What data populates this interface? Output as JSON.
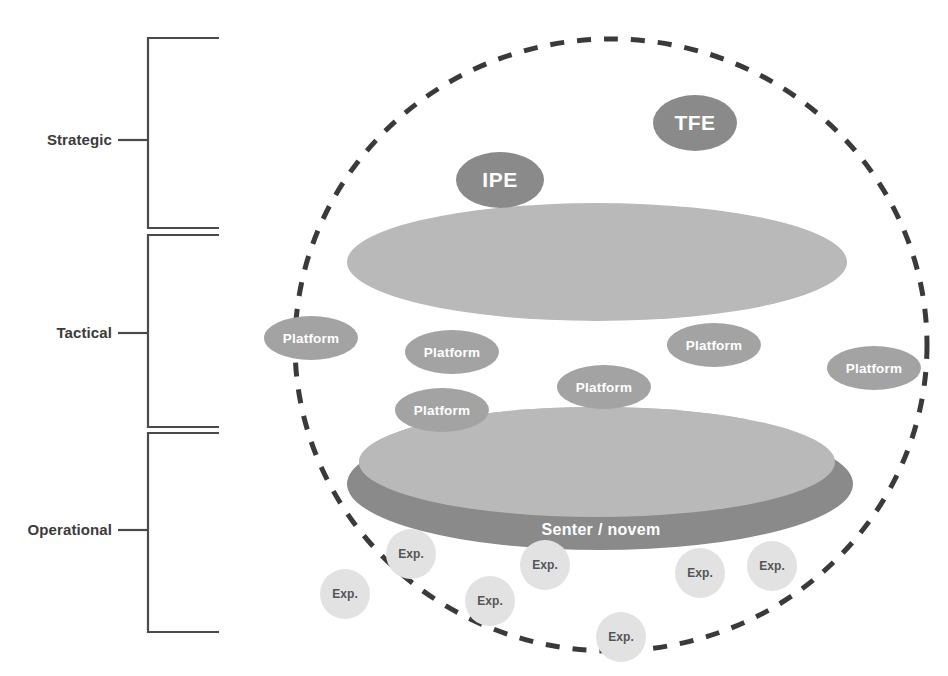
{
  "diagram": {
    "colors": {
      "bracket_line": "#4a4a4a",
      "label_text": "#3b3b3b",
      "dashed_boundary": "#3a3a3a",
      "upper_ellipse": "#b9b9b9",
      "lower_light_ellipse": "#b9b9b9",
      "senter_novem_ellipse": "#8a8a8a",
      "entity_ellipse": "#8a8a8a",
      "platform_ellipse": "#a3a3a3",
      "exp_circle": "#e2e2e2",
      "exp_text": "#555555",
      "white_text": "#ffffff"
    },
    "axis": {
      "name": "level-bracket-axis",
      "levels": [
        {
          "id": "strategic",
          "label": "Strategic",
          "tick_y": 140,
          "bracket_top": 38,
          "bracket_bottom": 228
        },
        {
          "id": "tactical",
          "label": "Tactical",
          "tick_y": 333,
          "bracket_top": 235,
          "bracket_bottom": 427
        },
        {
          "id": "operational",
          "label": "Operational",
          "tick_y": 530,
          "bracket_top": 433,
          "bracket_bottom": 632
        }
      ],
      "bracket_x": 148,
      "bracket_arm_right": 219,
      "tick_left": 118
    },
    "boundary": {
      "name": "dashed-system-boundary",
      "shape": "ellipse",
      "cx": 611,
      "cy": 345,
      "rx": 316,
      "ry": 306,
      "dash": "14 13",
      "stroke_width": 5
    },
    "shapes": {
      "upper_ellipse": {
        "cx": 597,
        "cy": 262,
        "rx": 250,
        "ry": 59
      },
      "senter_ellipse": {
        "cx": 600,
        "cy": 484,
        "rx": 253,
        "ry": 66
      },
      "lower_light_ellipse": {
        "cx": 597,
        "cy": 462,
        "rx": 238,
        "ry": 55
      }
    },
    "nodes": [
      {
        "id": "tfe",
        "label": "TFE",
        "type": "entity",
        "cx": 695,
        "cy": 123,
        "rx": 42,
        "ry": 28,
        "style": "lbl-big"
      },
      {
        "id": "ipe",
        "label": "IPE",
        "type": "entity",
        "cx": 500,
        "cy": 180,
        "rx": 44,
        "ry": 28,
        "style": "lbl-big"
      }
    ],
    "platforms": [
      {
        "id": "platform-left-outer",
        "label": "Platform",
        "cx": 311,
        "cy": 338,
        "rx": 47,
        "ry": 22
      },
      {
        "id": "platform-left-inner",
        "label": "Platform",
        "cx": 452,
        "cy": 352,
        "rx": 47,
        "ry": 22
      },
      {
        "id": "platform-right-inner",
        "label": "Platform",
        "cx": 714,
        "cy": 345,
        "rx": 47,
        "ry": 22
      },
      {
        "id": "platform-right-outer",
        "label": "Platform",
        "cx": 874,
        "cy": 368,
        "rx": 47,
        "ry": 22
      },
      {
        "id": "platform-center",
        "label": "Platform",
        "cx": 604,
        "cy": 387,
        "rx": 47,
        "ry": 22
      },
      {
        "id": "platform-lower-left",
        "label": "Platform",
        "cx": 442,
        "cy": 410,
        "rx": 47,
        "ry": 22
      }
    ],
    "senter": {
      "id": "senter-novem",
      "label": "Senter / novem",
      "label_cx": 601,
      "label_cy": 530
    },
    "experiments": [
      {
        "id": "exp-1",
        "label": "Exp.",
        "cx": 411,
        "cy": 554,
        "r": 25
      },
      {
        "id": "exp-2",
        "label": "Exp.",
        "cx": 545,
        "cy": 565,
        "r": 25
      },
      {
        "id": "exp-3",
        "label": "Exp.",
        "cx": 700,
        "cy": 573,
        "r": 25
      },
      {
        "id": "exp-4",
        "label": "Exp.",
        "cx": 772,
        "cy": 566,
        "r": 25
      },
      {
        "id": "exp-5",
        "label": "Exp.",
        "cx": 345,
        "cy": 594,
        "r": 25
      },
      {
        "id": "exp-6",
        "label": "Exp.",
        "cx": 490,
        "cy": 601,
        "r": 25
      },
      {
        "id": "exp-7",
        "label": "Exp.",
        "cx": 621,
        "cy": 637,
        "r": 25
      }
    ]
  }
}
